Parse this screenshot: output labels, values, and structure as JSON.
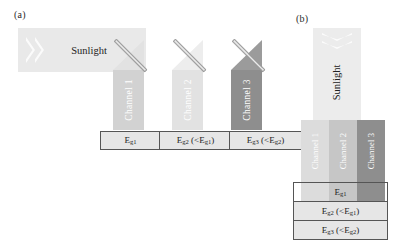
{
  "figure": {
    "panel_a": {
      "tag": "(a)",
      "sunlight_label": "Sunlight",
      "chevron_icon": "chevron-right-icon",
      "mirror_icon": "dichroic-mirror-icon",
      "mirrors": [
        {
          "name": "mirror-1"
        },
        {
          "name": "mirror-2"
        },
        {
          "name": "mirror-3"
        }
      ],
      "channels": [
        {
          "label": "Channel 1",
          "color": "#d2d2d2"
        },
        {
          "label": "Channel 2",
          "color": "#e2e2e2"
        },
        {
          "label": "Channel 3",
          "color": "#8e8e8e"
        }
      ],
      "bandgap_boxes": [
        {
          "id": "eg1",
          "main": "E",
          "sub": "g1",
          "compare": ""
        },
        {
          "id": "eg2",
          "main": "E",
          "sub": "g2",
          "compare": "(<E",
          "compare_sub": "g1",
          "compare_end": ")"
        },
        {
          "id": "eg3",
          "main": "E",
          "sub": "g3",
          "compare": "(<E",
          "compare_sub": "g2",
          "compare_end": ")"
        }
      ]
    },
    "panel_b": {
      "tag": "(b)",
      "sunlight_label": "Sunlight",
      "chevron_icon": "chevron-down-icon",
      "channels": [
        {
          "label": "Channel 1",
          "color": "#dcdcdc"
        },
        {
          "label": "Channel 2",
          "color": "#c6c6c6"
        },
        {
          "label": "Channel 3",
          "color": "#8e8e8e"
        }
      ],
      "bandgap_rows": [
        {
          "id": "eg1",
          "main": "E",
          "sub": "g1",
          "compare": "",
          "compare_sub": "",
          "compare_end": ""
        },
        {
          "id": "eg2",
          "main": "E",
          "sub": "g2",
          "compare": "(<E",
          "compare_sub": "g1",
          "compare_end": ")"
        },
        {
          "id": "eg3",
          "main": "E",
          "sub": "g3",
          "compare": "(<E",
          "compare_sub": "g2",
          "compare_end": ")"
        }
      ]
    },
    "colors": {
      "beam": "#e9e9e9",
      "box_fill": "#e6e6e6",
      "box_border": "#555555",
      "text": "#1d1d1d",
      "channel_text": "#ffffff"
    }
  }
}
